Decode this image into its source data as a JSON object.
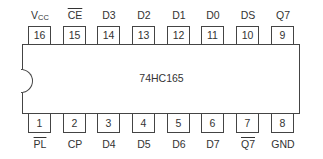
{
  "chip": {
    "part_number": "74HC165",
    "package": "DIP-16",
    "colors": {
      "outline": "#444444",
      "text": "#333333",
      "background": "#ffffff"
    }
  },
  "top_pins": [
    {
      "number": "16",
      "signal": "VCC",
      "signal_main": "V",
      "signal_sub": "CC",
      "active_low": false
    },
    {
      "number": "15",
      "signal": "CE",
      "active_low": true
    },
    {
      "number": "14",
      "signal": "D3",
      "active_low": false
    },
    {
      "number": "13",
      "signal": "D2",
      "active_low": false
    },
    {
      "number": "12",
      "signal": "D1",
      "active_low": false
    },
    {
      "number": "11",
      "signal": "D0",
      "active_low": false
    },
    {
      "number": "10",
      "signal": "DS",
      "active_low": false
    },
    {
      "number": "9",
      "signal": "Q7",
      "active_low": false
    }
  ],
  "bottom_pins": [
    {
      "number": "1",
      "signal": "PL",
      "active_low": true
    },
    {
      "number": "2",
      "signal": "CP",
      "active_low": false
    },
    {
      "number": "3",
      "signal": "D4",
      "active_low": false
    },
    {
      "number": "4",
      "signal": "D5",
      "active_low": false
    },
    {
      "number": "5",
      "signal": "D6",
      "active_low": false
    },
    {
      "number": "6",
      "signal": "D7",
      "active_low": false
    },
    {
      "number": "7",
      "signal": "Q7",
      "active_low": true
    },
    {
      "number": "8",
      "signal": "GND",
      "active_low": false
    }
  ]
}
